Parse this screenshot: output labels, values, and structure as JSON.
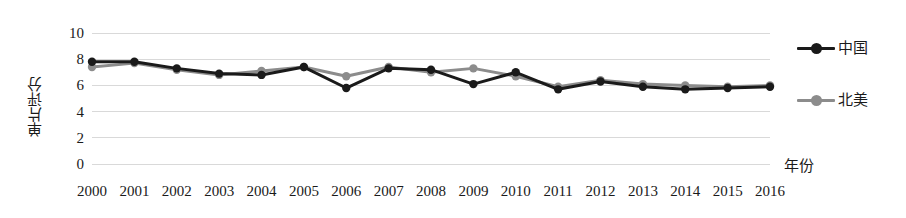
{
  "chart_data": {
    "type": "line",
    "title": "",
    "xlabel": "年份",
    "ylabel": "单片评分",
    "categories": [
      "2000",
      "2001",
      "2002",
      "2003",
      "2004",
      "2005",
      "2006",
      "2007",
      "2008",
      "2009",
      "2010",
      "2011",
      "2012",
      "2013",
      "2014",
      "2015",
      "2016"
    ],
    "x": [
      2000,
      2001,
      2002,
      2003,
      2004,
      2005,
      2006,
      2007,
      2008,
      2009,
      2010,
      2011,
      2012,
      2013,
      2014,
      2015,
      2016
    ],
    "ylim": [
      0,
      10
    ],
    "yticks": [
      0,
      2,
      4,
      6,
      8,
      10
    ],
    "ytick_labels": [
      "0",
      "2",
      "4",
      "6",
      "8",
      "10"
    ],
    "grid": true,
    "grid_axis": "y",
    "grid_color": "#d9d9d9",
    "legend_position": "right",
    "series": [
      {
        "name": "中国",
        "color": "#1a1a1a",
        "marker": "circle",
        "values": [
          7.8,
          7.8,
          7.3,
          6.9,
          6.8,
          7.4,
          5.8,
          7.3,
          7.2,
          6.1,
          7.0,
          5.7,
          6.3,
          5.9,
          5.7,
          5.8,
          5.9
        ]
      },
      {
        "name": "北美",
        "color": "#8c8c8c",
        "marker": "circle",
        "values": [
          7.4,
          7.7,
          7.2,
          6.8,
          7.1,
          7.4,
          6.7,
          7.4,
          7.0,
          7.3,
          6.7,
          5.9,
          6.4,
          6.1,
          6.0,
          5.9,
          6.0
        ]
      }
    ]
  },
  "legend": {
    "items": [
      {
        "label": "中国",
        "color": "#1a1a1a"
      },
      {
        "label": "北美",
        "color": "#8c8c8c"
      }
    ]
  },
  "axes": {
    "y_title": "单片评分",
    "x_title": "年份"
  }
}
